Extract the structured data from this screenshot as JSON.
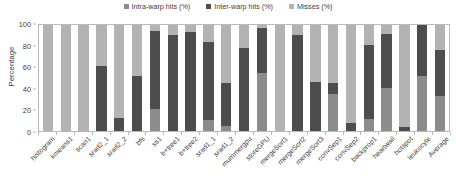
{
  "chart_data": {
    "type": "bar",
    "subtype": "stacked-bar",
    "title": "",
    "xlabel": "",
    "ylabel": "Percentage",
    "ylim": [
      0,
      100
    ],
    "yticks": [
      0,
      20,
      40,
      60,
      80,
      100
    ],
    "grid": false,
    "legend_position": "top-center",
    "categories": [
      "histogram",
      "kmeans1",
      "scan1",
      "srad2_1",
      "srad2_2",
      "bfs",
      "ss1",
      "b+tree1",
      "b+tree2",
      "srad1_1",
      "srad1_2",
      "mummergpu",
      "storeGPU",
      "mergeSort1",
      "mergeSort2",
      "mergeSort3",
      "convSep1",
      "convSep2",
      "backprop1",
      "heartwall",
      "hotspot",
      "leukocyte",
      "Average"
    ],
    "series": [
      {
        "name": "Intra-warp hits (%)",
        "color": "#8c8c8c",
        "values": [
          0,
          0,
          0,
          0,
          0,
          0,
          21,
          0,
          0,
          10,
          5,
          0,
          55,
          0,
          0,
          0,
          35,
          0,
          11,
          41,
          0,
          52,
          33
        ]
      },
      {
        "name": "Inter-warp hits (%)",
        "color": "#4d4d4d",
        "values": [
          0,
          0,
          0,
          61,
          12,
          52,
          73,
          91,
          93,
          74,
          40,
          78,
          42,
          0,
          91,
          46,
          10,
          8,
          70,
          51,
          4,
          48,
          43
        ]
      },
      {
        "name": "Misses (%)",
        "color": "#b3b3b3",
        "values": [
          100,
          100,
          100,
          39,
          88,
          48,
          6,
          9,
          7,
          16,
          55,
          22,
          3,
          100,
          9,
          54,
          55,
          92,
          19,
          8,
          96,
          0,
          24
        ]
      }
    ],
    "stack_tops": {
      "note": "cumulative top of intra then intra+inter, percent",
      "intra_top": [
        0,
        0,
        0,
        0,
        0,
        0,
        21,
        0,
        0,
        10,
        5,
        0,
        55,
        0,
        0,
        0,
        35,
        0,
        11,
        41,
        0,
        52,
        33
      ],
      "inter_top": [
        0,
        0,
        0,
        61,
        12,
        52,
        94,
        91,
        93,
        84,
        45,
        78,
        97,
        0,
        91,
        46,
        45,
        8,
        81,
        92,
        4,
        100,
        76
      ]
    }
  },
  "legend": {
    "items": [
      {
        "label": "Intra-warp hits (%)",
        "color": "#8c8c8c",
        "name": "legend-intra-warp"
      },
      {
        "label": "Inter-warp hits (%)",
        "color": "#4d4d4d",
        "name": "legend-inter-warp"
      },
      {
        "label": "Misses (%)",
        "color": "#b3b3b3",
        "name": "legend-misses"
      }
    ]
  },
  "axes": {
    "y_title": "Percentage",
    "y_ticks": [
      "0",
      "20",
      "40",
      "60",
      "80",
      "100"
    ]
  },
  "colors": {
    "intra": "#8c8c8c",
    "inter": "#4d4d4d",
    "misses": "#b3b3b3",
    "frame": "#b9b9b9",
    "text": "#404040",
    "background": "#ffffff"
  }
}
